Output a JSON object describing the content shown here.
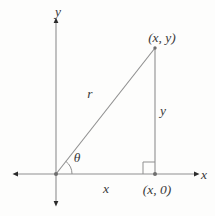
{
  "figure": {
    "axes": {
      "x_label": "x",
      "y_label": "y"
    },
    "points": {
      "apex_label": "(x, y)",
      "foot_label": "(x, 0)"
    },
    "sides": {
      "hypotenuse_label": "r",
      "vertical_label": "y",
      "horizontal_label": "x"
    },
    "angle": {
      "label": "θ"
    },
    "colors": {
      "background": "#fdfdfc",
      "line": "#8f8f8f",
      "text": "#3a3a3a",
      "point": "#6e6e6e",
      "arrow": "#2b2b2b"
    }
  }
}
